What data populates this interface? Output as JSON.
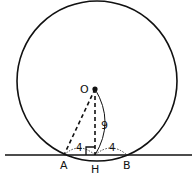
{
  "diagram": {
    "points": {
      "O": {
        "label": "O"
      },
      "A": {
        "label": "A"
      },
      "H": {
        "label": "H"
      },
      "B": {
        "label": "B"
      }
    },
    "measurements": {
      "OH": "9",
      "AH": "4",
      "HB": "4"
    },
    "colors": {
      "stroke": "#111111",
      "background": "#ffffff"
    }
  }
}
